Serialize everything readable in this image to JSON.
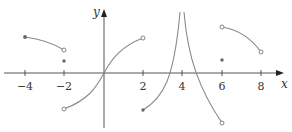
{
  "graph": {
    "title": "",
    "axes": {
      "x_label": "x",
      "y_label": "y",
      "x_ticks": [
        "−4",
        "−2",
        "2",
        "4",
        "6",
        "8"
      ],
      "x_tick_values": [
        -4,
        -2,
        2,
        4,
        6,
        8
      ]
    },
    "colors": {
      "axis": "#444444",
      "curve": "#8a8a8a",
      "open_point_fill": "#ffffff",
      "closed_point_fill": "#666666"
    },
    "pieces": [
      {
        "name": "segment-left",
        "from": [
          -4,
          1.5
        ],
        "to": [
          -2,
          0.9
        ],
        "start": "closed",
        "end": "open"
      },
      {
        "name": "isolated-point-neg2",
        "at": [
          -2,
          0.45
        ],
        "type": "closed"
      },
      {
        "name": "s-curve-center",
        "from": [
          -2,
          -1.5
        ],
        "to": [
          2,
          1.5
        ],
        "start": "open",
        "end": "open",
        "through": [
          0,
          0
        ]
      },
      {
        "name": "asymptote-left-branch",
        "from": [
          2,
          -1.5
        ],
        "to": [
          3.9,
          3.5
        ],
        "start": "closed",
        "vertical_asymptote": 4
      },
      {
        "name": "asymptote-right-branch",
        "from": [
          4.1,
          3.5
        ],
        "to": [
          6,
          -1.8
        ],
        "end": "open",
        "vertical_asymptote": 4
      },
      {
        "name": "segment-right",
        "from": [
          6,
          1.8
        ],
        "to": [
          8,
          0.9
        ],
        "start": "open",
        "end": "open"
      },
      {
        "name": "isolated-point-6",
        "at": [
          6,
          0.45
        ],
        "type": "closed"
      }
    ]
  }
}
